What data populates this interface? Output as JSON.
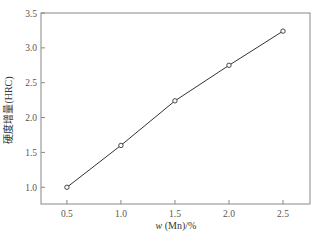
{
  "chart_data": {
    "type": "line",
    "title": "",
    "xlabel": "w (Mn)/%",
    "xlabel_parts": {
      "var": "w",
      "rest": " (Mn)/%"
    },
    "ylabel": "硬度增量(HRC)",
    "xlim": [
      0.26,
      2.75
    ],
    "ylim": [
      0.76,
      3.5
    ],
    "xticks": [
      0.5,
      1.0,
      1.5,
      2.0,
      2.5
    ],
    "xtick_labels": [
      "0.5",
      "1.0",
      "1.5",
      "2.0",
      "2.5"
    ],
    "yticks": [
      1.0,
      1.5,
      2.0,
      2.5,
      3.0,
      3.5
    ],
    "ytick_labels": [
      "1.0",
      "1.5",
      "2.0",
      "2.5",
      "3.0",
      "3.5"
    ],
    "grid": false,
    "legend": null,
    "series": [
      {
        "name": "硬度增量",
        "marker": "open-circle",
        "color": "#333333",
        "x": [
          0.5,
          1.0,
          1.5,
          2.0,
          2.5
        ],
        "values": [
          1.0,
          1.6,
          2.24,
          2.75,
          3.24
        ]
      }
    ]
  },
  "colors": {
    "axis": "#888888",
    "line": "#333333",
    "text": "#555555"
  }
}
